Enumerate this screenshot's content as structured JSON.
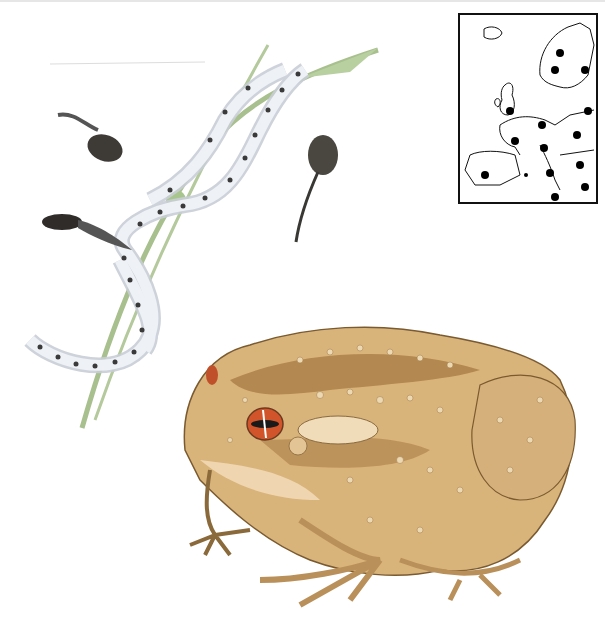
{
  "illustration": {
    "subject": "toad life cycle illustration",
    "elements": [
      "adult toad",
      "tadpoles",
      "spawn strings on grass stem",
      "range map of Europe"
    ]
  },
  "colors": {
    "background": "#ffffff",
    "toad_body": "#d9b47a",
    "toad_dark": "#8a5a2a",
    "toad_belly": "#efd6b0",
    "eye_iris": "#d2542a",
    "spawn": "#e4e8ee",
    "egg": "#3a3a3a",
    "stem": "#9fb884",
    "tadpole": "#3a3835"
  },
  "map": {
    "region": "Europe",
    "range_dots": 15
  }
}
